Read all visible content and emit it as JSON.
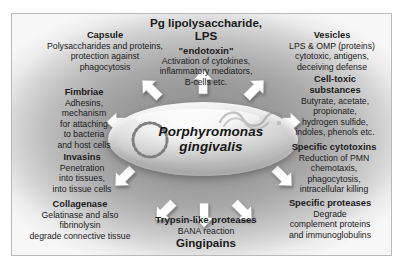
{
  "figure": {
    "organism_name_line1": "Porphyromonas",
    "organism_name_line2": "gingivalis",
    "top_center": {
      "title_line1": "Pg lipolysaccharide,",
      "title_line2": "LPS",
      "subtitle": "\"endotoxin\"",
      "body_line1": "Activation of cytokines,",
      "body_line2": "inflammatory mediators,",
      "body_line3": "B-cells etc."
    },
    "bottom_center": {
      "title": "Trypsin-like proteases",
      "body": "BANA reaction",
      "footer": "Gingipains"
    },
    "blocks": [
      {
        "name": "capsule",
        "heading": "Capsule",
        "lines": [
          "Polysaccharides and proteins,",
          "protection against",
          "phagocytosis"
        ]
      },
      {
        "name": "fimbriae",
        "heading": "Fimbriae",
        "lines": [
          "Adhesins,",
          "mechanism",
          "for attaching",
          "to bacteria",
          "and host cells"
        ]
      },
      {
        "name": "invasins",
        "heading": "Invasins",
        "lines": [
          "Penetration",
          "into tissues,",
          "into tissue cells"
        ]
      },
      {
        "name": "collagenase",
        "heading": "Collagenase",
        "lines": [
          "Gelatinase and also",
          "fibrinolysin",
          "degrade connective tissue"
        ]
      },
      {
        "name": "vesicles",
        "heading": "Vesicles",
        "lines": [
          "LPS & OMP (proteins)",
          "cytotoxic, antigens,",
          "deceiving defense"
        ]
      },
      {
        "name": "cell-toxic-substances",
        "heading": "Cell-toxic",
        "heading2": "substances",
        "lines": [
          "Butyrate, acetate,",
          "propionate,",
          "hydrogen sulfide,",
          "indoles, phenols etc."
        ]
      },
      {
        "name": "specific-cytotoxins",
        "heading": "Specific cytotoxins",
        "lines": [
          "Reduction of PMN",
          "chemotaxis,",
          "phagocytosis,",
          "intracellular killing"
        ]
      },
      {
        "name": "specific-proteases",
        "heading": "Specific proteases",
        "lines": [
          "Degrade",
          "complement proteins",
          "and immunoglobulins"
        ]
      }
    ],
    "colors": {
      "arrow_fill": "#ffffff",
      "arrow_stroke": "#9a9a9a",
      "text": "#1b1b1b",
      "frame_border": "#b9b9b9"
    }
  }
}
